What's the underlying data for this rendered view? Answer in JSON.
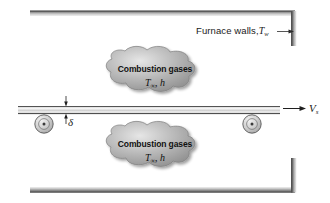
{
  "figure": {
    "name": "furnace-sheet-heat-transfer-diagram",
    "background_color": "#ffffff"
  },
  "labels": {
    "furnace_walls": {
      "text": "Furnace walls,",
      "symbol": "T",
      "subscript": "w"
    },
    "combustion_gases_top": {
      "title": "Combustion gases",
      "symbol": "T",
      "subscript": "∞",
      "separator": ",",
      "coefficient": "h"
    },
    "combustion_gases_bottom": {
      "title": "Combustion gases",
      "symbol": "T",
      "subscript": "∞",
      "separator": ",",
      "coefficient": "h"
    },
    "thickness": {
      "symbol": "δ"
    },
    "velocity": {
      "symbol": "V",
      "subscript": "s"
    }
  },
  "elements": {
    "top_wall": "furnace-top-wall",
    "bottom_wall": "furnace-bottom-wall",
    "right_wall_top": "furnace-right-wall-upper",
    "right_wall_bottom": "furnace-right-wall-lower",
    "sheet": "moving-metal-sheet",
    "roller_left": "roller-left",
    "roller_right": "roller-right",
    "cloud_top": "combustion-gas-cloud-top",
    "cloud_bottom": "combustion-gas-cloud-bottom",
    "leader_line": "furnace-wall-leader-line",
    "velocity_arrow": "sheet-velocity-arrow",
    "thickness_dimension": "sheet-thickness-dimension"
  },
  "colors": {
    "wall_dark": "#5b5b5b",
    "wall_light": "#c9c9c9",
    "cloud_fill": "#b4b4b4",
    "cloud_edge": "#8e8e8e",
    "line": "#2b2b2b",
    "sheet_fill": "#f2f2f2",
    "roller_fill": "#d4d4d4"
  }
}
